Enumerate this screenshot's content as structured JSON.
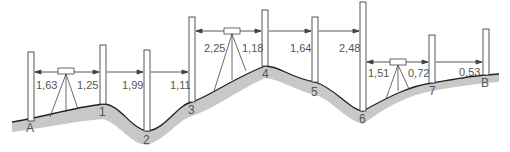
{
  "diagram": {
    "type": "levelling-survey-profile",
    "colors": {
      "ground_fill": "#c8c8c8",
      "ground_line": "#222222",
      "staff": "#ffffff",
      "staff_outline": "#444444",
      "text": "#555555"
    },
    "points": [
      {
        "id": "A",
        "label": "A"
      },
      {
        "id": "1",
        "label": "1"
      },
      {
        "id": "2",
        "label": "2"
      },
      {
        "id": "3",
        "label": "3"
      },
      {
        "id": "4",
        "label": "4"
      },
      {
        "id": "5",
        "label": "5"
      },
      {
        "id": "6",
        "label": "6"
      },
      {
        "id": "7",
        "label": "7"
      },
      {
        "id": "B",
        "label": "B"
      }
    ],
    "readings": [
      {
        "from_staff": "A",
        "value": "1,63"
      },
      {
        "from_staff": "1",
        "value": "1,25"
      },
      {
        "from_staff": "1",
        "value": "1,99"
      },
      {
        "from_staff": "2",
        "value": "1,11"
      },
      {
        "from_staff": "3",
        "value": "2,25"
      },
      {
        "from_staff": "4",
        "value": "1,18"
      },
      {
        "from_staff": "5",
        "value": "1,64"
      },
      {
        "from_staff": "6",
        "value": "2,48"
      },
      {
        "from_staff": "6",
        "value": "1,51"
      },
      {
        "from_staff": "7",
        "value": "0,72"
      },
      {
        "from_staff": "B",
        "value": "0,53"
      }
    ],
    "instruments": [
      {
        "id": "level-station-1"
      },
      {
        "id": "level-station-2"
      },
      {
        "id": "level-station-3"
      }
    ]
  }
}
